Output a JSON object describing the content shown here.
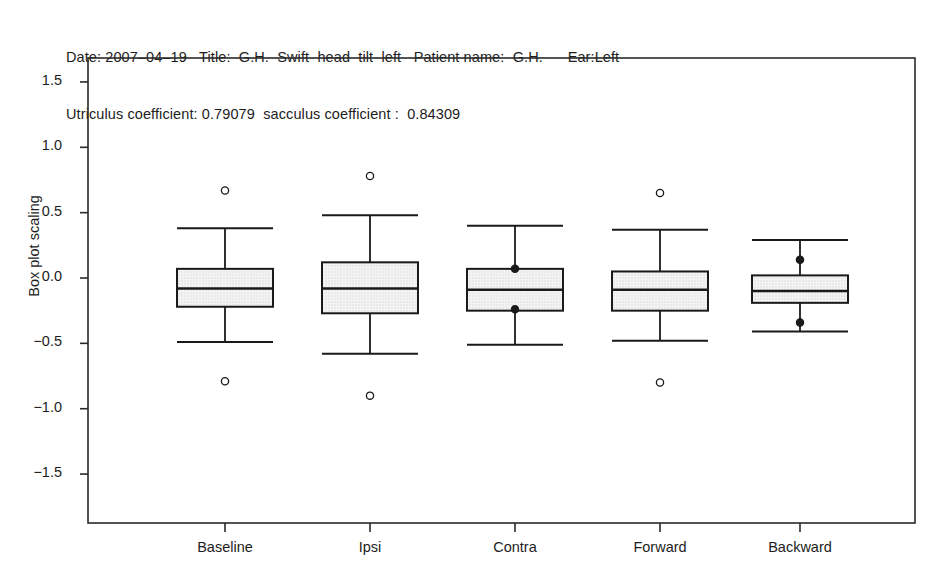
{
  "header": {
    "line1": "Date: 2007–04–19   Title:  G.H.  Swift  head  tilt  left   Patient name:  G.H.      Ear:Left",
    "line2": "Utriculus coefficient: 0.79079  sacculus coefficient :  0.84309"
  },
  "chart_data": {
    "type": "box",
    "title": "",
    "xlabel": "",
    "ylabel": "Box plot scaling",
    "ylim": [
      -1.72,
      1.72
    ],
    "yticks": [
      1.5,
      1.0,
      0.5,
      0.0,
      -0.5,
      -1.0,
      -1.5
    ],
    "ytick_labels": [
      "1.5",
      "1.0",
      "0.5",
      "0.0",
      "-0.5",
      "-1.0",
      "-1.5"
    ],
    "categories": [
      "Baseline",
      "Ipsi",
      "Contra",
      "Forward",
      "Backward"
    ],
    "grid": false,
    "legend": false,
    "boxes": [
      {
        "category": "Baseline",
        "whisker_high": 0.38,
        "q3": 0.07,
        "median": -0.08,
        "q1": -0.22,
        "whisker_low": -0.49,
        "outliers": [
          0.67,
          -0.79
        ],
        "points": []
      },
      {
        "category": "Ipsi",
        "whisker_high": 0.48,
        "q3": 0.12,
        "median": -0.08,
        "q1": -0.27,
        "whisker_low": -0.58,
        "outliers": [
          0.78,
          -0.9
        ],
        "points": []
      },
      {
        "category": "Contra",
        "whisker_high": 0.4,
        "q3": 0.07,
        "median": -0.09,
        "q1": -0.25,
        "whisker_low": -0.51,
        "outliers": [],
        "points": [
          0.07,
          -0.24
        ]
      },
      {
        "category": "Forward",
        "whisker_high": 0.37,
        "q3": 0.05,
        "median": -0.09,
        "q1": -0.25,
        "whisker_low": -0.48,
        "outliers": [
          0.65,
          -0.8
        ],
        "points": []
      },
      {
        "category": "Backward",
        "whisker_high": 0.29,
        "q3": 0.02,
        "median": -0.1,
        "q1": -0.19,
        "whisker_low": -0.41,
        "outliers": [],
        "points": [
          0.14,
          -0.34
        ]
      }
    ],
    "colors": {
      "box_fill": "#e9e9e9",
      "line": "#1a1a1a",
      "frame": "#2a2a2a",
      "background": "#ffffff"
    }
  }
}
